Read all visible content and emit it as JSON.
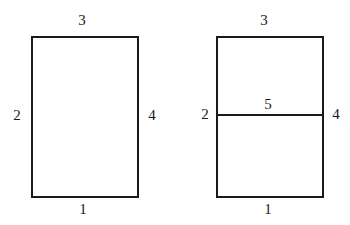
{
  "figure": {
    "background_color": "#ffffff",
    "stroke_color": "#1a1a1a",
    "shapes": [
      {
        "name": "plain-rectangle",
        "edges": [
          {
            "name": "bottom-edge",
            "label": "1"
          },
          {
            "name": "left-edge",
            "label": "2"
          },
          {
            "name": "top-edge",
            "label": "3"
          },
          {
            "name": "right-edge",
            "label": "4"
          }
        ]
      },
      {
        "name": "divided-rectangle",
        "edges": [
          {
            "name": "bottom-edge",
            "label": "1"
          },
          {
            "name": "left-edge",
            "label": "2"
          },
          {
            "name": "top-edge",
            "label": "3"
          },
          {
            "name": "right-edge",
            "label": "4"
          },
          {
            "name": "horizontal-divider-edge",
            "label": "5"
          }
        ]
      }
    ]
  },
  "chart_data": {
    "type": "diagram",
    "title": "",
    "elements": [
      {
        "id": "left-rectangle",
        "shape": "rectangle",
        "x": 31,
        "y": 36,
        "width": 108,
        "height": 162,
        "labels": [
          {
            "text": "3",
            "position": "above-top-edge",
            "x": 82,
            "y": 20
          },
          {
            "text": "2",
            "position": "left-of-left-edge",
            "x": 17,
            "y": 115
          },
          {
            "text": "4",
            "position": "right-of-right-edge",
            "x": 152,
            "y": 115
          },
          {
            "text": "1",
            "position": "below-bottom-edge",
            "x": 83,
            "y": 209
          }
        ]
      },
      {
        "id": "right-rectangle",
        "shape": "rectangle",
        "x": 216,
        "y": 36,
        "width": 108,
        "height": 162,
        "internal_lines": [
          {
            "id": "divider",
            "orientation": "horizontal",
            "y": 115,
            "x1": 216,
            "x2": 324
          }
        ],
        "labels": [
          {
            "text": "3",
            "position": "above-top-edge",
            "x": 264,
            "y": 20
          },
          {
            "text": "2",
            "position": "left-of-divider-junction",
            "x": 204,
            "y": 115
          },
          {
            "text": "5",
            "position": "above-divider",
            "x": 268,
            "y": 104
          },
          {
            "text": "4",
            "position": "right-of-divider-junction",
            "x": 335,
            "y": 115
          },
          {
            "text": "1",
            "position": "below-bottom-edge",
            "x": 268,
            "y": 209
          }
        ]
      }
    ]
  }
}
